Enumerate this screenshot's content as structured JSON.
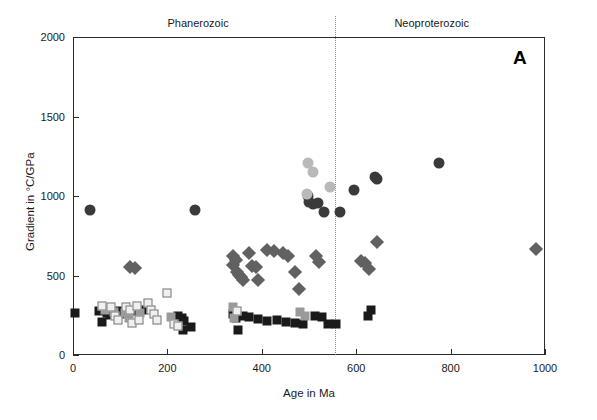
{
  "figure": {
    "panel_letter": "A"
  },
  "axes": {
    "x": {
      "title": "Age in Ma",
      "min": 0,
      "max": 1000,
      "ticks": [
        0,
        200,
        400,
        600,
        800,
        1000
      ],
      "ticklabels": [
        "0",
        "200",
        "400",
        "600",
        "800",
        "1000"
      ]
    },
    "y": {
      "title": "Gradient in °C/GPa",
      "min": 0,
      "max": 2000,
      "ticks": [
        0,
        500,
        1000,
        1500,
        2000
      ],
      "ticklabels": [
        "0",
        "500",
        "1000",
        "1500",
        "2000"
      ]
    }
  },
  "eras": {
    "divider_age": 555,
    "labels": [
      {
        "name": "phanerozoic",
        "text": "Phanerozoic",
        "center_age": 265
      },
      {
        "name": "neoproterozoic",
        "text": "Neoproterozoic",
        "center_age": 760
      }
    ]
  },
  "colors": {
    "frame": "#2b2b2b",
    "text": "#1a1a1a",
    "divider": "#8a8a8a",
    "circle_dark": "#3a3a3a",
    "circle_light": "#b9b9b9",
    "diamond_gray": "#616161",
    "square_black": "#1a1a1a",
    "square_gray": "#9a9a9a",
    "square_open": "#f0f0f0",
    "square_open_edge": "#777777"
  },
  "chart_data": {
    "type": "scatter",
    "title": "",
    "xlabel": "Age in Ma",
    "ylabel": "Gradient in °C/GPa",
    "xlim": [
      0,
      1000
    ],
    "ylim": [
      0,
      2000
    ],
    "grid": false,
    "legend_position": "none",
    "annotations": [
      "A",
      "Phanerozoic",
      "Neoproterozoic"
    ],
    "series": [
      {
        "name": "circles-dark",
        "marker": "circle",
        "fill": "#3a3a3a",
        "size": 11,
        "points": [
          [
            37,
            910
          ],
          [
            258,
            915
          ],
          [
            497,
            1000
          ],
          [
            500,
            965
          ],
          [
            508,
            950
          ],
          [
            520,
            955
          ],
          [
            532,
            900
          ],
          [
            565,
            900
          ],
          [
            595,
            1035
          ],
          [
            640,
            1120
          ],
          [
            645,
            1110
          ],
          [
            775,
            1210
          ]
        ]
      },
      {
        "name": "circles-light",
        "marker": "circle",
        "fill": "#b9b9b9",
        "size": 11,
        "points": [
          [
            498,
            1205
          ],
          [
            508,
            1150
          ],
          [
            495,
            1010
          ],
          [
            545,
            1055
          ]
        ]
      },
      {
        "name": "diamonds-gray",
        "marker": "diamond",
        "fill": "#616161",
        "size": 10,
        "points": [
          [
            120,
            555
          ],
          [
            132,
            548
          ],
          [
            338,
            565
          ],
          [
            340,
            620
          ],
          [
            345,
            600
          ],
          [
            348,
            525
          ],
          [
            352,
            505
          ],
          [
            356,
            490
          ],
          [
            360,
            470
          ],
          [
            372,
            640
          ],
          [
            380,
            560
          ],
          [
            388,
            555
          ],
          [
            392,
            470
          ],
          [
            412,
            660
          ],
          [
            425,
            655
          ],
          [
            445,
            640
          ],
          [
            455,
            620
          ],
          [
            470,
            525
          ],
          [
            478,
            415
          ],
          [
            515,
            620
          ],
          [
            522,
            585
          ],
          [
            610,
            590
          ],
          [
            618,
            580
          ],
          [
            628,
            540
          ],
          [
            645,
            710
          ],
          [
            980,
            665
          ]
        ]
      },
      {
        "name": "squares-black",
        "marker": "square",
        "fill": "#1a1a1a",
        "size": 9,
        "points": [
          [
            5,
            265
          ],
          [
            55,
            275
          ],
          [
            72,
            265
          ],
          [
            78,
            250
          ],
          [
            62,
            205
          ],
          [
            95,
            275
          ],
          [
            100,
            255
          ],
          [
            128,
            275
          ],
          [
            148,
            280
          ],
          [
            222,
            245
          ],
          [
            230,
            235
          ],
          [
            235,
            215
          ],
          [
            232,
            160
          ],
          [
            250,
            175
          ],
          [
            340,
            255
          ],
          [
            345,
            230
          ],
          [
            350,
            160
          ],
          [
            360,
            245
          ],
          [
            372,
            240
          ],
          [
            392,
            225
          ],
          [
            412,
            215
          ],
          [
            432,
            218
          ],
          [
            452,
            205
          ],
          [
            470,
            200
          ],
          [
            488,
            198
          ],
          [
            512,
            245
          ],
          [
            528,
            240
          ],
          [
            540,
            195
          ],
          [
            558,
            195
          ],
          [
            625,
            245
          ],
          [
            632,
            285
          ]
        ]
      },
      {
        "name": "squares-gray",
        "marker": "square",
        "fill": "#9a9a9a",
        "size": 9,
        "points": [
          [
            68,
            285
          ],
          [
            86,
            268
          ],
          [
            110,
            262
          ],
          [
            118,
            230
          ],
          [
            142,
            265
          ],
          [
            208,
            240
          ],
          [
            338,
            300
          ],
          [
            342,
            235
          ],
          [
            480,
            270
          ],
          [
            492,
            245
          ]
        ]
      },
      {
        "name": "squares-open",
        "marker": "square-open",
        "fill": "#f0f0f0",
        "edge": "#777777",
        "size": 9,
        "points": [
          [
            62,
            310
          ],
          [
            80,
            300
          ],
          [
            90,
            245
          ],
          [
            96,
            220
          ],
          [
            112,
            300
          ],
          [
            120,
            285
          ],
          [
            125,
            200
          ],
          [
            135,
            310
          ],
          [
            140,
            220
          ],
          [
            158,
            330
          ],
          [
            165,
            285
          ],
          [
            172,
            255
          ],
          [
            178,
            222
          ],
          [
            200,
            390
          ],
          [
            215,
            195
          ],
          [
            222,
            180
          ],
          [
            348,
            275
          ]
        ]
      }
    ]
  }
}
